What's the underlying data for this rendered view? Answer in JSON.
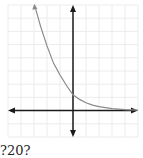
{
  "caption": "?20?",
  "colors": {
    "grid": "#ececec",
    "axis": "#1a1a1a",
    "curve": "#8a8a8a",
    "background": "#ffffff"
  },
  "chart_data": {
    "type": "line",
    "title": "",
    "xlabel": "",
    "ylabel": "",
    "grid": true,
    "xlim": [
      -5,
      5
    ],
    "ylim": [
      -2,
      8
    ],
    "grid_step": 1,
    "axes_arrows": true,
    "series": [
      {
        "name": "curve",
        "x": [
          -2.9,
          -2.5,
          -2,
          -1.5,
          -1,
          -0.5,
          0,
          0.5,
          1,
          1.5,
          2,
          3,
          4,
          5
        ],
        "y": [
          7.8,
          6.4,
          4.9,
          3.6,
          2.7,
          1.9,
          1.2,
          0.85,
          0.6,
          0.42,
          0.3,
          0.15,
          0.07,
          0.03
        ]
      }
    ],
    "y_intercept": 1.2
  }
}
